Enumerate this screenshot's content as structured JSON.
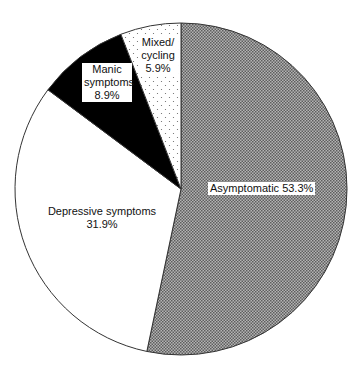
{
  "chart_data": {
    "type": "pie",
    "title": "",
    "start_angle_deg": 0,
    "direction": "clockwise",
    "categories": [
      "Asymptomatic",
      "Depressive symptoms",
      "Manic symptoms",
      "Mixed/cycling"
    ],
    "values": [
      53.3,
      31.9,
      8.9,
      5.9
    ],
    "unit": "%",
    "fills": [
      "checker-gray",
      "white",
      "black",
      "dotted"
    ],
    "labels": [
      {
        "line1": "Asymptomatic 53.3%",
        "line2": ""
      },
      {
        "line1": "Depressive symptoms",
        "line2": "31.9%"
      },
      {
        "line1": "Manic",
        "line2": "symptoms",
        "line3": "8.9%"
      },
      {
        "line1": "Mixed/",
        "line2": "cycling",
        "line3": "5.9%"
      }
    ]
  },
  "colors": {
    "checker_dark": "#6e6e6e",
    "checker_light": "#b8b8b8",
    "manic": "#000000",
    "outline": "#333333",
    "dots": "#555555"
  }
}
